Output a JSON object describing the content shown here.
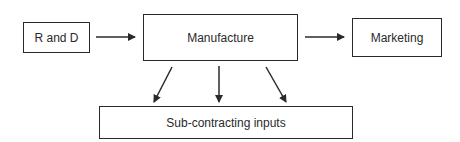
{
  "diagram": {
    "nodes": [
      {
        "id": "rd",
        "label": "R and D"
      },
      {
        "id": "manufacture",
        "label": "Manufacture"
      },
      {
        "id": "marketing",
        "label": "Marketing"
      },
      {
        "id": "subcontracting",
        "label": "Sub-contracting inputs"
      }
    ],
    "edges": [
      {
        "from": "rd",
        "to": "manufacture"
      },
      {
        "from": "manufacture",
        "to": "marketing"
      },
      {
        "from": "manufacture",
        "to": "subcontracting",
        "position": "left"
      },
      {
        "from": "manufacture",
        "to": "subcontracting",
        "position": "center"
      },
      {
        "from": "manufacture",
        "to": "subcontracting",
        "position": "right"
      }
    ],
    "colors": {
      "stroke": "#2a2a2a",
      "background": "#ffffff"
    }
  }
}
